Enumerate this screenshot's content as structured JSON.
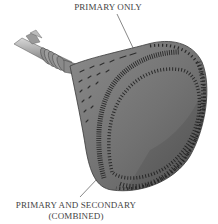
{
  "figure": {
    "labels": {
      "primary_only": "PRIMARY ONLY",
      "primary_and_secondary_line1": "PRIMARY AND SECONDARY",
      "primary_and_secondary_line2": "(COMBINED)"
    },
    "colors": {
      "background": "#ffffff",
      "body_fill": "#7a7a7a",
      "body_dark": "#5e5e5e",
      "hatch": "#2e2e2e",
      "label_text": "#444444",
      "leader_line": "#555555"
    }
  }
}
